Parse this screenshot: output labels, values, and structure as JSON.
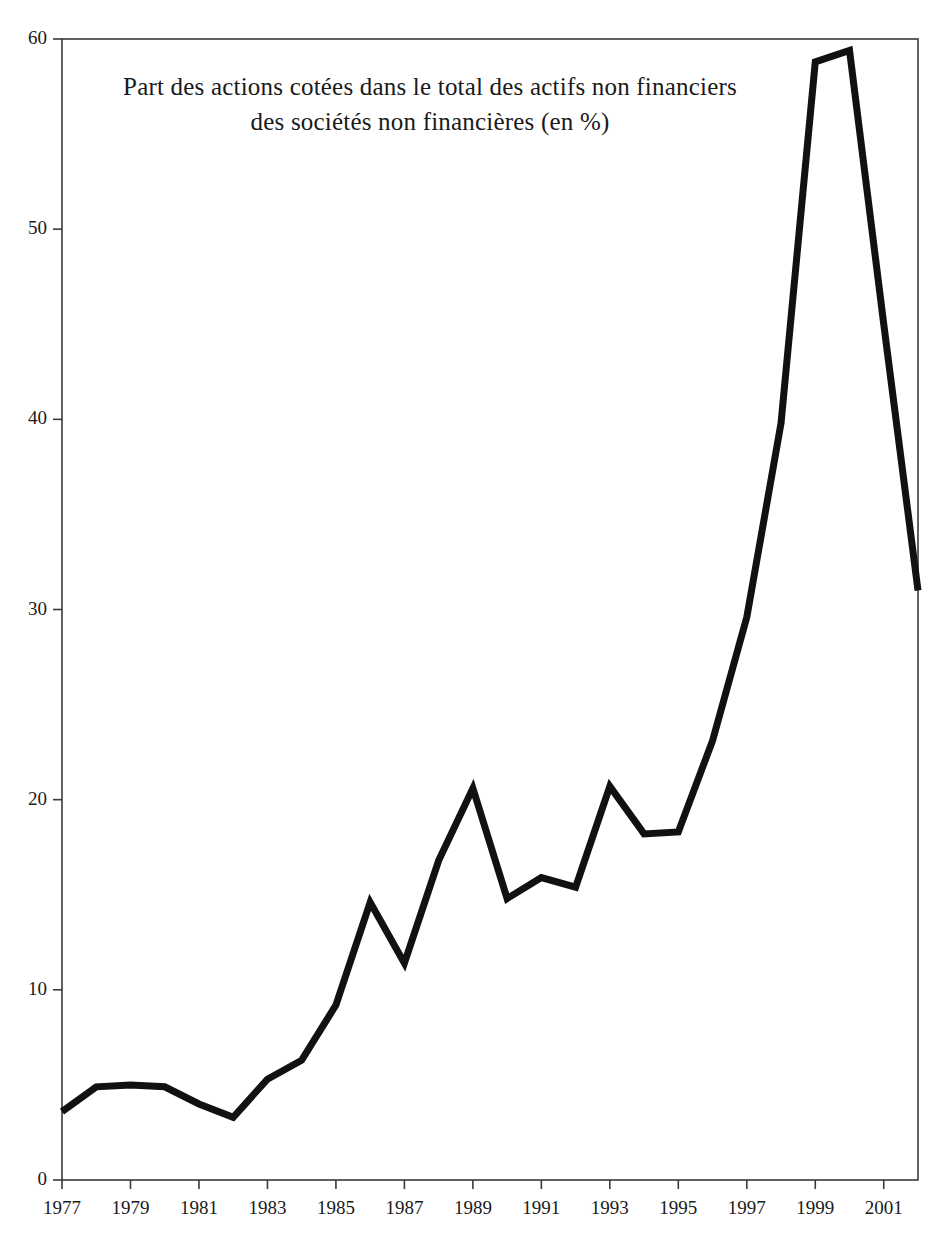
{
  "chart_data": {
    "type": "line",
    "title": "Part des actions cotées dans le total des actifs non financiers des sociétés non financières (en %)",
    "title_lines": [
      "Part des actions cotées dans le total des actifs non financiers",
      "des sociétés non financières (en %)"
    ],
    "xlabel": "",
    "ylabel": "",
    "xlim": [
      1977,
      2002
    ],
    "ylim": [
      0,
      60
    ],
    "grid": false,
    "legend": false,
    "line_color": "#111111",
    "line_width": 7,
    "axis_color": "#3a3a3a",
    "background": "#ffffff",
    "x": [
      1977,
      1978,
      1979,
      1980,
      1981,
      1982,
      1983,
      1984,
      1985,
      1986,
      1987,
      1988,
      1989,
      1990,
      1991,
      1992,
      1993,
      1994,
      1995,
      1996,
      1997,
      1998,
      1999,
      2000,
      2001,
      2002
    ],
    "values": [
      3.6,
      4.9,
      5.0,
      4.9,
      4.0,
      3.3,
      5.3,
      6.3,
      9.2,
      14.6,
      11.4,
      16.8,
      20.6,
      14.8,
      15.9,
      15.4,
      20.7,
      18.2,
      18.3,
      23.1,
      29.6,
      39.8,
      58.8,
      59.4,
      45.0,
      31.0
    ],
    "series": [
      {
        "name": "Part des actions cotées",
        "values": [
          3.6,
          4.9,
          5.0,
          4.9,
          4.0,
          3.3,
          5.3,
          6.3,
          9.2,
          14.6,
          11.4,
          16.8,
          20.6,
          14.8,
          15.9,
          15.4,
          20.7,
          18.2,
          18.3,
          23.1,
          29.6,
          39.8,
          58.8,
          59.4,
          45.0,
          31.0
        ]
      }
    ],
    "yticks": [
      0,
      10,
      20,
      30,
      40,
      50,
      60
    ],
    "ytick_labels": [
      "0",
      "10",
      "20",
      "30",
      "40",
      "50",
      "60"
    ],
    "xticks": [
      1977,
      1979,
      1981,
      1983,
      1985,
      1987,
      1989,
      1991,
      1993,
      1995,
      1997,
      1999,
      2001
    ],
    "xtick_labels": [
      "1977",
      "1979",
      "1981",
      "1983",
      "1985",
      "1987",
      "1989",
      "1991",
      "1993",
      "1995",
      "1997",
      "1999",
      "2001"
    ]
  }
}
